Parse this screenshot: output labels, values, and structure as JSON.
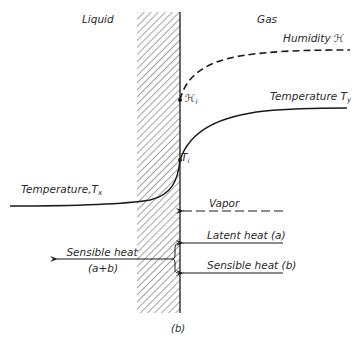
{
  "figure": {
    "caption": "(b)",
    "regions": {
      "left": "Liquid",
      "right": "Gas"
    },
    "curves": {
      "humidity": {
        "label": "Humidity",
        "symbol": "ℋ",
        "style": "dashed"
      },
      "humidity_interface": {
        "symbol": "ℋ",
        "subscript": "i"
      },
      "gas_temperature": {
        "label": "Temperature",
        "symbol": "T",
        "subscript": "y",
        "style": "solid"
      },
      "interface_temperature": {
        "symbol": "T",
        "subscript": "i"
      },
      "liquid_temperature": {
        "label": "Temperature,",
        "symbol": "T",
        "subscript": "x",
        "style": "solid"
      }
    },
    "arrows": {
      "vapor": {
        "label": "Vapor",
        "style": "dashed",
        "direction": "left"
      },
      "latent_heat": {
        "label": "Latent heat (a)",
        "direction": "left"
      },
      "sensible_heat_gas": {
        "label": "Sensible heat (b)",
        "direction": "left"
      },
      "sensible_heat_liquid": {
        "label_line1": "Sensible heat",
        "label_line2": "(a+b)",
        "direction": "left"
      }
    },
    "colors": {
      "ink": "#1a1a1a",
      "hatch": "#555555",
      "background": "#ffffff"
    }
  }
}
